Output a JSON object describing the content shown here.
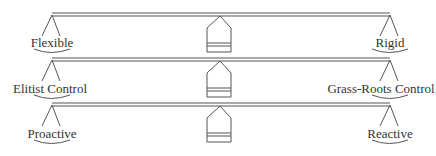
{
  "diagram": {
    "type": "balance-scales",
    "stroke_color": "#555555",
    "scales": [
      {
        "left_label": "Flexible",
        "right_label": "Rigid"
      },
      {
        "left_label": "Elitist Control",
        "right_label": "Grass-Roots Control"
      },
      {
        "left_label": "Proactive",
        "right_label": "Reactive"
      }
    ]
  }
}
